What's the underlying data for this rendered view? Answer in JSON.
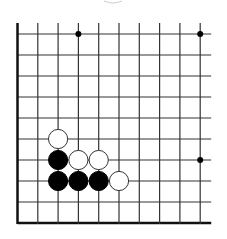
{
  "board": {
    "type": "go-diagram",
    "columns": 10,
    "rows": 10,
    "origin_x": 17.5,
    "origin_y": 34,
    "spacing_x": 20.3,
    "spacing_y": 21,
    "edges": {
      "left": "closed",
      "bottom": "closed",
      "top": "open",
      "right": "open"
    },
    "open_extension": 11,
    "colors": {
      "line": "#333333",
      "edge": "#111111",
      "background": "#ffffff",
      "black_stone": "#000000",
      "white_stone": "#ffffff",
      "stone_border": "#333333",
      "hoshi": "#000000"
    },
    "star_points": [
      {
        "col": 3,
        "row": 0
      },
      {
        "col": 9,
        "row": 0
      },
      {
        "col": 9,
        "row": 6
      }
    ],
    "stones": [
      {
        "color": "white",
        "col": 2,
        "row": 5
      },
      {
        "color": "black",
        "col": 2,
        "row": 6
      },
      {
        "color": "white",
        "col": 3,
        "row": 6
      },
      {
        "color": "white",
        "col": 4,
        "row": 6
      },
      {
        "color": "black",
        "col": 2,
        "row": 7
      },
      {
        "color": "black",
        "col": 3,
        "row": 7
      },
      {
        "color": "black",
        "col": 4,
        "row": 7
      },
      {
        "color": "white",
        "col": 5,
        "row": 7
      }
    ],
    "partial_top_mark": {
      "x": 113,
      "y": 0
    }
  }
}
